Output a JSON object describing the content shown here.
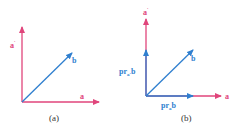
{
  "colors": {
    "pink": "#e0457b",
    "blue": "#2f7fcf",
    "caption": "#333333"
  },
  "panels": [
    {
      "caption": "(a)",
      "labels": {
        "a_perp": "a",
        "a_perp_mark": "'",
        "b": "b",
        "a": "a"
      }
    },
    {
      "caption": "(b)",
      "labels": {
        "a_perp": "a",
        "a_perp_mark": "'",
        "proj_vertical": "pr",
        "proj_vertical_sub": "a'",
        "proj_vertical_b": "b",
        "b": "b",
        "proj_horizontal": "pr",
        "proj_horizontal_sub": "a",
        "proj_horizontal_b": "b",
        "a": "a"
      }
    }
  ]
}
